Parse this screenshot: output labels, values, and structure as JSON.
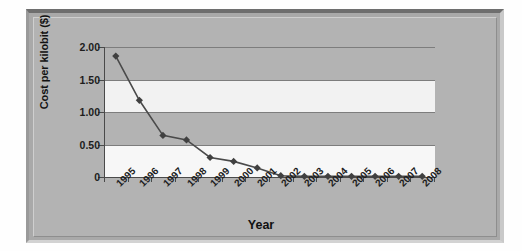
{
  "chart_data": {
    "type": "line",
    "title": "",
    "xlabel": "Year",
    "ylabel": "Cost per kilobit ($)",
    "categories": [
      "1995",
      "1996",
      "1997",
      "1998",
      "1999",
      "2000",
      "2001",
      "2002",
      "2003",
      "2004",
      "2005",
      "2006",
      "2007",
      "2008"
    ],
    "values": [
      1.86,
      1.18,
      0.64,
      0.57,
      0.3,
      0.24,
      0.14,
      0.02,
      0.01,
      0.01,
      0.01,
      0.01,
      0.01,
      0.01
    ],
    "series": [
      {
        "name": "Cost per kilobit",
        "values": [
          1.86,
          1.18,
          0.64,
          0.57,
          0.3,
          0.24,
          0.14,
          0.02,
          0.01,
          0.01,
          0.01,
          0.01,
          0.01,
          0.01
        ]
      }
    ],
    "ylim": [
      0,
      2.0
    ],
    "ytick_labels": [
      "2.00",
      "1.50",
      "1.00",
      "0.50",
      "0"
    ],
    "ytick_values": [
      2.0,
      1.5,
      1.0,
      0.5,
      0
    ],
    "grid": true,
    "legend": false,
    "marker": "diamond",
    "colors": {
      "line": "#4a4a4a",
      "marker": "#404040",
      "plot_band_dark": "#b3b3b3",
      "plot_band_light": "#f2f2f2",
      "chart_background": "#b3b3b3",
      "axis": "#4a4a4a",
      "text": "#1d1d1d"
    }
  }
}
